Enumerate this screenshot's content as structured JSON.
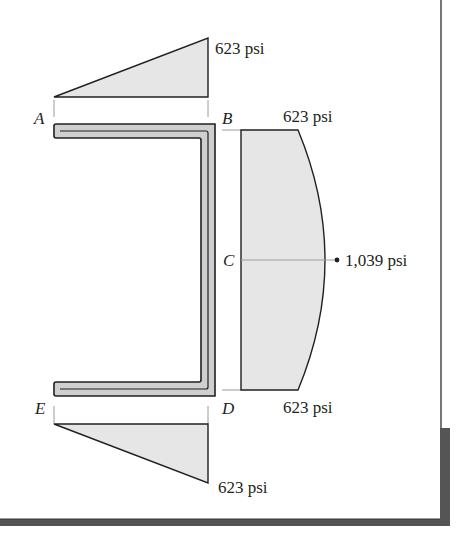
{
  "figure": {
    "type": "stress distribution diagram",
    "colors": {
      "fill": "#e6e6e6",
      "stroke": "#231f20",
      "section_fill": "#cfcfcf",
      "frame": "#4a4a4a",
      "guide": "#9a9a9a"
    },
    "points": {
      "A": "A",
      "B": "B",
      "C": "C",
      "D": "D",
      "E": "E"
    },
    "labels": {
      "top_flange_max": "623 psi",
      "web_top": "623 psi",
      "web_mid": "1,039 psi",
      "web_bottom": "623 psi",
      "bottom_flange_max": "623 psi"
    },
    "diagrams": [
      {
        "name": "top-flange-stress",
        "shape": "triangle",
        "from": "A",
        "to": "B",
        "min": 0,
        "max": 623,
        "unit": "psi"
      },
      {
        "name": "web-stress",
        "shape": "parabolic",
        "from": "B",
        "to": "D",
        "ends": 623,
        "peak_at": "C",
        "peak": 1039,
        "unit": "psi"
      },
      {
        "name": "bottom-flange-stress",
        "shape": "triangle",
        "from": "E",
        "to": "D",
        "min": 0,
        "max": 623,
        "unit": "psi"
      }
    ]
  }
}
